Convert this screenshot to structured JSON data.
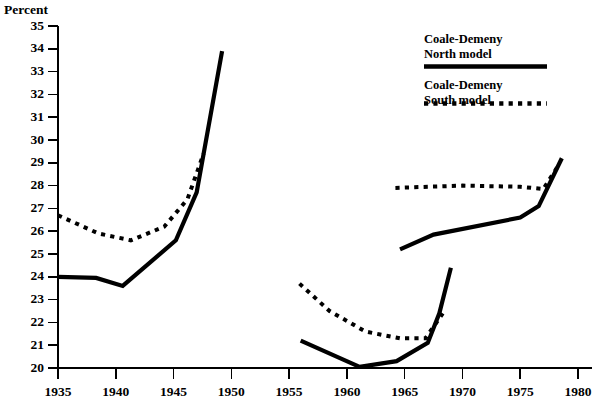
{
  "chart_data": {
    "type": "line",
    "title": "",
    "xlabel": "",
    "ylabel": "Percent",
    "xlim": [
      1935,
      1980
    ],
    "ylim": [
      20,
      35
    ],
    "grid": false,
    "legend_position": "top-right",
    "x_ticks": [
      1935,
      1940,
      1945,
      1950,
      1955,
      1960,
      1965,
      1970,
      1975,
      1980
    ],
    "x_tick_labels": [
      "1935",
      "1940",
      "1945",
      "1950",
      "1955",
      "1960",
      "1965",
      "1970",
      "1975",
      "1980"
    ],
    "y_ticks": [
      20,
      21,
      22,
      23,
      24,
      25,
      26,
      27,
      28,
      29,
      30,
      31,
      32,
      33,
      34,
      35
    ],
    "y_tick_labels": [
      "20",
      "21",
      "22",
      "23",
      "24",
      "25",
      "26",
      "27",
      "28",
      "29",
      "30",
      "31",
      "32",
      "33",
      "34",
      "35"
    ],
    "series": [
      {
        "name": "Coale-Demeny North model",
        "style": "solid",
        "color": "#000000",
        "segments": [
          {
            "x": [
              1935.0,
              1938.3,
              1940.6,
              1945.2,
              1947.0,
              1949.2
            ],
            "y": [
              24.0,
              23.95,
              23.6,
              25.6,
              27.7,
              33.9
            ]
          },
          {
            "x": [
              1956.0,
              1961.1,
              1964.3,
              1967.0,
              1968.0,
              1969.0
            ],
            "y": [
              21.2,
              20.05,
              20.3,
              21.1,
              22.4,
              24.4
            ]
          },
          {
            "x": [
              1964.6,
              1967.5,
              1975.0,
              1976.6,
              1978.6
            ],
            "y": [
              25.2,
              25.85,
              26.6,
              27.1,
              29.2
            ]
          }
        ]
      },
      {
        "name": "Coale-Demeny South model",
        "style": "dotted",
        "color": "#000000",
        "segments": [
          {
            "x": [
              1935.0,
              1938.5,
              1941.3,
              1944.2,
              1946.2,
              1947.6
            ],
            "y": [
              26.7,
              25.9,
              25.6,
              26.2,
              27.4,
              29.4
            ]
          },
          {
            "x": [
              1955.9,
              1958.5,
              1961.6,
              1964.6,
              1966.8,
              1968.3
            ],
            "y": [
              23.7,
              22.5,
              21.6,
              21.3,
              21.3,
              22.4
            ]
          },
          {
            "x": [
              1964.2,
              1970.0,
              1975.0,
              1977.0,
              1978.2
            ],
            "y": [
              27.9,
              28.0,
              27.95,
              27.85,
              28.8
            ]
          }
        ]
      }
    ]
  },
  "legend": {
    "entries": [
      {
        "line1": "Coale-Demeny",
        "line2": "North model",
        "style": "solid"
      },
      {
        "line1": "Coale-Demeny",
        "line2": "South model",
        "style": "dotted"
      }
    ]
  }
}
